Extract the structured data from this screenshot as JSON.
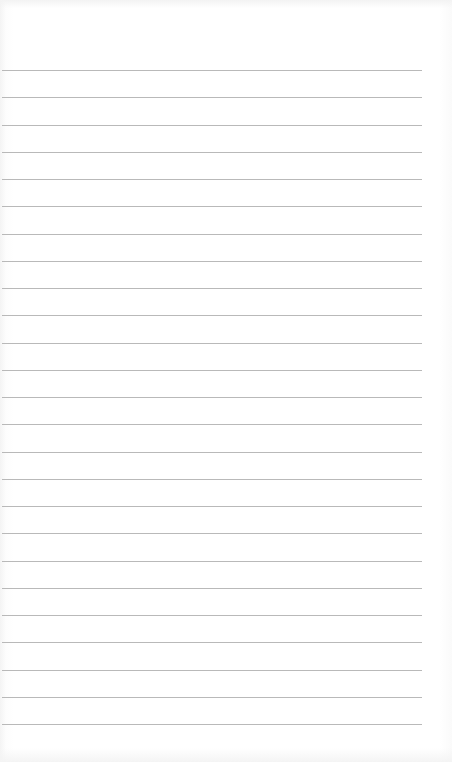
{
  "sheet": {
    "type": "lined-paper",
    "background_color": "#ffffff",
    "rule_color": "#b9b9b9",
    "rule_count": 25,
    "first_rule_y": 70,
    "rule_spacing": 27.25,
    "rule_left": 2,
    "rule_right": 422,
    "content": ""
  }
}
